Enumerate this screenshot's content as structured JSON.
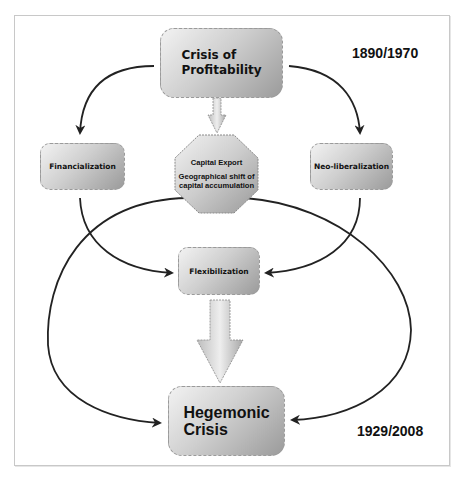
{
  "diagram": {
    "nodes": {
      "crisis_of_profitability": {
        "line1": "Crisis of",
        "line2": "Profitability"
      },
      "capital_export": {
        "title": "Capital Export",
        "line1": "Geographical shift of",
        "line2": "capital accumulation"
      },
      "financialization": {
        "label": "Financialization"
      },
      "neo_liberalization": {
        "label": "Neo-liberalization"
      },
      "flexibilization": {
        "label": "Flexibilization"
      },
      "hegemonic_crisis": {
        "line1": "Hegemonic",
        "line2": "Crisis"
      }
    },
    "annotations": {
      "top_years": "1890/1970",
      "bottom_years": "1929/2008"
    },
    "edges": [
      {
        "from": "Crisis of Profitability",
        "to": "Financialization"
      },
      {
        "from": "Crisis of Profitability",
        "to": "Neo-liberalization"
      },
      {
        "from": "Crisis of Profitability",
        "to": "Capital Export"
      },
      {
        "from": "Financialization",
        "to": "Flexibilization"
      },
      {
        "from": "Neo-liberalization",
        "to": "Flexibilization"
      },
      {
        "from": "Capital Export",
        "to": "Hegemonic Crisis",
        "side": "left"
      },
      {
        "from": "Capital Export",
        "to": "Hegemonic Crisis",
        "side": "right"
      },
      {
        "from": "Flexibilization",
        "to": "Hegemonic Crisis"
      }
    ],
    "colors": {
      "box_light": "#f2f2f2",
      "box_dark": "#9b9b9b",
      "line": "#222222",
      "frame": "#c8c8c8"
    }
  }
}
